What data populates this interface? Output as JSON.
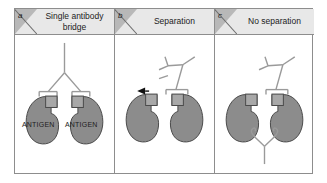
{
  "figure": {
    "kind": "scientific-diagram",
    "panel_count": 3
  },
  "panels": [
    {
      "letter": "a",
      "title": "Single antibody bridge",
      "title_line1": "Single antibody",
      "title_line2": "bridge",
      "antigen_label_left": "ANTIGEN",
      "antigen_label_right": "ANTIGEN",
      "antibody_count": 1,
      "state": "bridged"
    },
    {
      "letter": "b",
      "title": "Separation",
      "antigen_label_left": "",
      "antigen_label_right": "",
      "antibody_count": 1,
      "state": "detached",
      "arrow": "release-arrow"
    },
    {
      "letter": "c",
      "title": "No separation",
      "antigen_label_left": "",
      "antigen_label_right": "",
      "antibody_count": 2,
      "state": "double-bridged"
    }
  ],
  "colors": {
    "antigen_fill": "#8c8c8c",
    "antigen_stroke": "#4a4a4a",
    "fab_fill": "#b0b0b0",
    "fab_stroke": "#4a4a4a",
    "antibody_stroke": "#9a9a9a",
    "header_band": "#e8e8e8",
    "letter_tab": "#b8b8b8",
    "frame_border": "#8d8d8d",
    "text": "#1c1c1c",
    "arrow_fill": "#111111",
    "background": "#ffffff"
  }
}
